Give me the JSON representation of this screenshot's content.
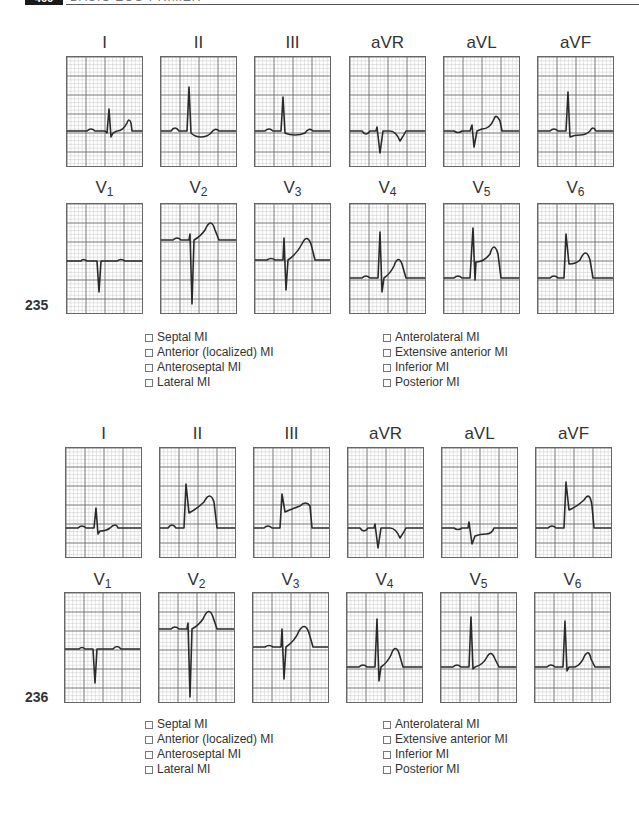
{
  "header": {
    "page_number": "466",
    "running_title": "BASIC ECG PRIMER"
  },
  "leads_order": [
    "I",
    "II",
    "III",
    "aVR",
    "aVL",
    "aVF",
    "V1",
    "V2",
    "V3",
    "V4",
    "V5",
    "V6"
  ],
  "questions": [
    {
      "number": "235",
      "leads": {
        "I": {
          "label": "I"
        },
        "II": {
          "label": "II"
        },
        "III": {
          "label": "III"
        },
        "aVR": {
          "label": "aVR"
        },
        "aVL": {
          "label": "aVL"
        },
        "aVF": {
          "label": "aVF"
        },
        "V1": {
          "label": "V",
          "sub": "1"
        },
        "V2": {
          "label": "V",
          "sub": "2"
        },
        "V3": {
          "label": "V",
          "sub": "3"
        },
        "V4": {
          "label": "V",
          "sub": "4"
        },
        "V5": {
          "label": "V",
          "sub": "5"
        },
        "V6": {
          "label": "V",
          "sub": "6"
        }
      },
      "options_left": [
        "Septal MI",
        "Anterior (localized) MI",
        "Anteroseptal MI",
        "Lateral MI"
      ],
      "options_right": [
        "Anterolateral MI",
        "Extensive anterior MI",
        "Inferior MI",
        "Posterior MI"
      ]
    },
    {
      "number": "236",
      "leads": {
        "I": {
          "label": "I"
        },
        "II": {
          "label": "II"
        },
        "III": {
          "label": "III"
        },
        "aVR": {
          "label": "aVR"
        },
        "aVL": {
          "label": "aVL"
        },
        "aVF": {
          "label": "aVF"
        },
        "V1": {
          "label": "V",
          "sub": "1"
        },
        "V2": {
          "label": "V",
          "sub": "2"
        },
        "V3": {
          "label": "V",
          "sub": "3"
        },
        "V4": {
          "label": "V",
          "sub": "4"
        },
        "V5": {
          "label": "V",
          "sub": "5"
        },
        "V6": {
          "label": "V",
          "sub": "6"
        }
      },
      "options_left": [
        "Septal MI",
        "Anterior (localized) MI",
        "Anteroseptal MI",
        "Lateral MI"
      ],
      "options_right": [
        "Anterolateral MI",
        "Extensive anterior MI",
        "Inferior MI",
        "Posterior MI"
      ]
    }
  ],
  "colors": {
    "grid_minor": "#c8c8c8",
    "grid_major": "#6a6a6a",
    "trace": "#2a2a2a",
    "border": "#666666"
  }
}
